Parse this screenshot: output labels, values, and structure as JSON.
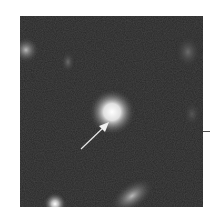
{
  "image": {
    "kind": "grayscale astronomical image",
    "background_color": "#2a2a2a",
    "sources": [
      {
        "name": "central-bright-source",
        "cx": 92,
        "cy": 96,
        "r": 10,
        "peak": "#ffffff"
      },
      {
        "name": "upper-left-source",
        "cx": 6,
        "cy": 34,
        "r": 8,
        "peak": "#8a8a8a"
      },
      {
        "name": "upper-faint-source",
        "cx": 48,
        "cy": 46,
        "r": 7,
        "peak": "#555555"
      },
      {
        "name": "upper-right-source",
        "cx": 168,
        "cy": 36,
        "r": 9,
        "peak": "#606060"
      },
      {
        "name": "right-faint-source",
        "cx": 172,
        "cy": 98,
        "r": 8,
        "peak": "#454545"
      },
      {
        "name": "bottom-left-source",
        "cx": 35,
        "cy": 188,
        "r": 7,
        "peak": "#d0d0d0"
      },
      {
        "name": "bottom-center-source",
        "cx": 106,
        "cy": 186,
        "r": 14,
        "peak": "#9a9a9a"
      }
    ],
    "arrow": {
      "from": [
        61,
        133
      ],
      "to": [
        87,
        108
      ],
      "color": "#e8e8e8"
    }
  },
  "right_tick": {
    "y": 131
  }
}
